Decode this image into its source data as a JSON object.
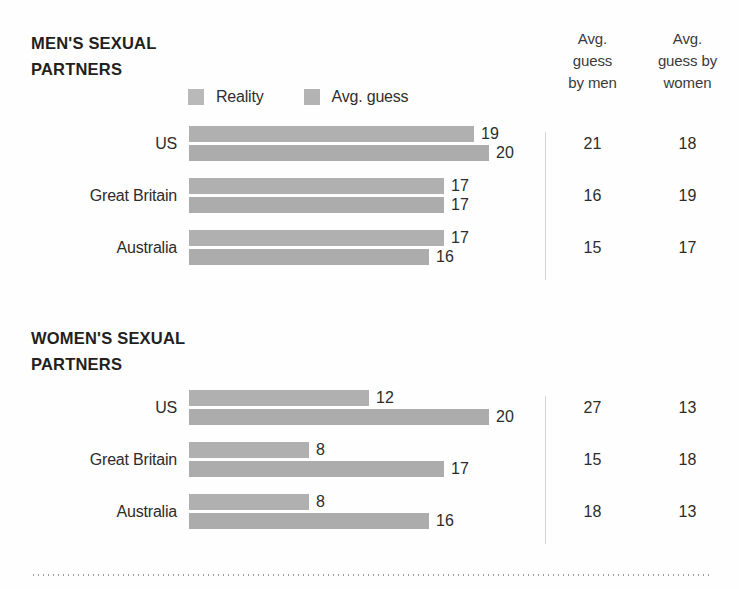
{
  "table_headers": [
    {
      "lines": [
        "Avg.",
        "guess",
        "by men"
      ]
    },
    {
      "lines": [
        "Avg.",
        "guess by",
        "women"
      ]
    }
  ],
  "legend": {
    "items": [
      {
        "label": "Reality",
        "swatch": "reality-swatch",
        "color": "#b9b9b9"
      },
      {
        "label": "Avg. guess",
        "swatch": "avg-guess-swatch",
        "color": "#b3b3b3"
      }
    ]
  },
  "sections": [
    {
      "title_lines": [
        "MEN'S SEXUAL",
        "PARTNERS"
      ],
      "rows": [
        {
          "label": "US",
          "reality": 19,
          "avg_guess": 20,
          "guess_by_men": 21,
          "guess_by_women": 18
        },
        {
          "label": "Great Britain",
          "reality": 17,
          "avg_guess": 17,
          "guess_by_men": 16,
          "guess_by_women": 19
        },
        {
          "label": "Australia",
          "reality": 17,
          "avg_guess": 16,
          "guess_by_men": 15,
          "guess_by_women": 17
        }
      ]
    },
    {
      "title_lines": [
        "WOMEN'S SEXUAL",
        "PARTNERS"
      ],
      "rows": [
        {
          "label": "US",
          "reality": 12,
          "avg_guess": 20,
          "guess_by_men": 27,
          "guess_by_women": 13
        },
        {
          "label": "Great Britain",
          "reality": 8,
          "avg_guess": 17,
          "guess_by_men": 15,
          "guess_by_women": 18
        },
        {
          "label": "Australia",
          "reality": 8,
          "avg_guess": 16,
          "guess_by_men": 18,
          "guess_by_women": 13
        }
      ]
    }
  ],
  "chart_data": [
    {
      "type": "bar",
      "title": "MEN'S SEXUAL PARTNERS",
      "orientation": "horizontal",
      "categories": [
        "US",
        "Great Britain",
        "Australia"
      ],
      "series": [
        {
          "name": "Reality",
          "values": [
            19,
            17,
            17
          ]
        },
        {
          "name": "Avg. guess",
          "values": [
            20,
            17,
            16
          ]
        }
      ],
      "xlabel": "",
      "ylabel": "",
      "xlim": [
        0,
        21
      ],
      "grid": false,
      "legend_position": "top",
      "data_labels": true,
      "table": {
        "columns": [
          "Avg. guess by men",
          "Avg. guess by women"
        ],
        "rows": [
          {
            "category": "US",
            "values": [
              21,
              18
            ]
          },
          {
            "category": "Great Britain",
            "values": [
              16,
              19
            ]
          },
          {
            "category": "Australia",
            "values": [
              15,
              17
            ]
          }
        ]
      }
    },
    {
      "type": "bar",
      "title": "WOMEN'S SEXUAL PARTNERS",
      "orientation": "horizontal",
      "categories": [
        "US",
        "Great Britain",
        "Australia"
      ],
      "series": [
        {
          "name": "Reality",
          "values": [
            12,
            8,
            8
          ]
        },
        {
          "name": "Avg. guess",
          "values": [
            20,
            17,
            16
          ]
        }
      ],
      "xlabel": "",
      "ylabel": "",
      "xlim": [
        0,
        21
      ],
      "grid": false,
      "legend_position": "top",
      "data_labels": true,
      "table": {
        "columns": [
          "Avg. guess by men",
          "Avg. guess by women"
        ],
        "rows": [
          {
            "category": "US",
            "values": [
              27,
              13
            ]
          },
          {
            "category": "Great Britain",
            "values": [
              15,
              18
            ]
          },
          {
            "category": "Australia",
            "values": [
              18,
              13
            ]
          }
        ]
      }
    }
  ],
  "scale": {
    "max_value": 20,
    "max_pixel_width": 300
  }
}
